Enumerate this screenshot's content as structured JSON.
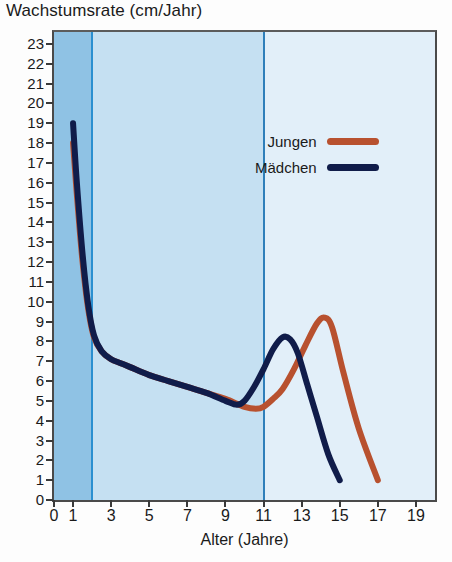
{
  "title": "Wachstumsrate (cm/Jahr)",
  "xaxis_title": "Alter (Jahre)",
  "legend": {
    "items": [
      {
        "label": "Jungen",
        "color": "#b8512f"
      },
      {
        "label": "Mädchen",
        "color": "#101c4a"
      }
    ]
  },
  "chart_data": {
    "type": "line",
    "title": "Wachstumsrate (cm/Jahr)",
    "xlabel": "Alter (Jahre)",
    "ylabel": "Wachstumsrate (cm/Jahr)",
    "xlim": [
      0,
      20
    ],
    "ylim": [
      0,
      23.6
    ],
    "grid": false,
    "legend_position": "inside-top-right",
    "xticks": [
      0,
      1,
      3,
      5,
      7,
      9,
      11,
      13,
      15,
      17,
      19
    ],
    "yticks": [
      0,
      1,
      2,
      3,
      4,
      5,
      6,
      7,
      8,
      9,
      10,
      11,
      12,
      13,
      14,
      15,
      16,
      17,
      18,
      19,
      20,
      21,
      22,
      23
    ],
    "background_bands": [
      {
        "name": "Kleinkindphase",
        "x_from": 0,
        "x_to": 2,
        "color": "#8fc2e4"
      },
      {
        "name": "Kindheitsphase",
        "x_from": 2,
        "x_to": 11,
        "color": "#c5e0f2"
      },
      {
        "name": "Pubertaetsphase",
        "x_from": 11,
        "x_to": 20,
        "color": "#e2eff9"
      }
    ],
    "vertical_markers": [
      {
        "x": 2,
        "color": "#2a8fd0"
      },
      {
        "x": 11,
        "color": "#2f7fba"
      }
    ],
    "series": [
      {
        "name": "Jungen",
        "color": "#b8512f",
        "x": [
          1.0,
          1.2,
          1.5,
          1.8,
          2.1,
          2.5,
          3.0,
          3.5,
          4.0,
          5.0,
          6.0,
          7.0,
          8.0,
          9.0,
          10.0,
          10.6,
          11.0,
          11.5,
          12.0,
          12.6,
          13.2,
          13.8,
          14.2,
          14.6,
          15.2,
          16.0,
          17.0
        ],
        "y": [
          18.0,
          15.4,
          12.0,
          9.6,
          8.2,
          7.5,
          7.1,
          6.9,
          6.7,
          6.3,
          6.0,
          5.7,
          5.4,
          5.1,
          4.7,
          4.6,
          4.7,
          5.1,
          5.6,
          6.6,
          7.8,
          8.9,
          9.2,
          8.7,
          6.4,
          3.6,
          1.0
        ]
      },
      {
        "name": "Mädchen",
        "color": "#101c4a",
        "x": [
          1.0,
          1.2,
          1.5,
          1.8,
          2.1,
          2.5,
          3.0,
          3.5,
          4.0,
          5.0,
          6.0,
          7.0,
          8.0,
          9.0,
          9.6,
          10.0,
          10.5,
          11.0,
          11.5,
          12.0,
          12.4,
          12.8,
          13.3,
          13.8,
          14.4,
          15.0
        ],
        "y": [
          19.0,
          16.0,
          12.4,
          9.8,
          8.3,
          7.5,
          7.1,
          6.9,
          6.7,
          6.3,
          6.0,
          5.7,
          5.4,
          5.0,
          4.8,
          5.0,
          5.7,
          6.6,
          7.6,
          8.2,
          8.1,
          7.4,
          5.8,
          4.2,
          2.3,
          1.0
        ]
      }
    ]
  }
}
